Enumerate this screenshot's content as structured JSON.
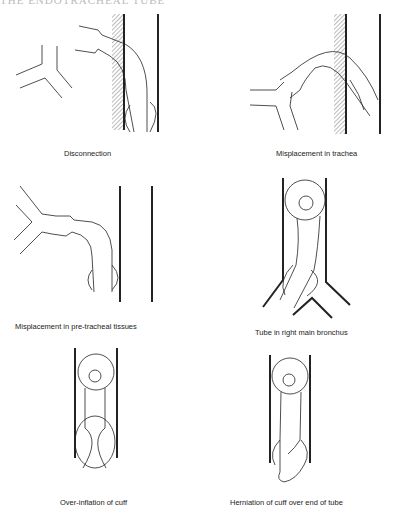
{
  "header": {
    "text": "THE ENDOTRACHEAL TUBE"
  },
  "figures": [
    {
      "id": "disconnection",
      "caption": "Disconnection"
    },
    {
      "id": "misplacement-trachea",
      "caption": "Misplacement in trachea"
    },
    {
      "id": "misplacement-pretracheal",
      "caption": "Misplacement in pre-tracheal tissues"
    },
    {
      "id": "right-main-bronchus",
      "caption": "Tube in right main bronchus"
    },
    {
      "id": "over-inflation",
      "caption": "Over-inflation of cuff"
    },
    {
      "id": "herniation",
      "caption": "Herniation of cuff over end of tube"
    }
  ],
  "colors": {
    "ink": "#222222",
    "hatch": "#888888"
  }
}
